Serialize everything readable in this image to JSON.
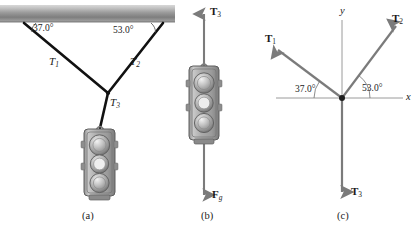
{
  "figure": {
    "background_color": "#ffffff",
    "ink_color": "#1a1a1a",
    "vector_color": "#7b7b7b",
    "axis_color": "#8c8c8c",
    "cable_color": "#111111",
    "width": 416,
    "height": 227
  },
  "panels": [
    {
      "id": "a",
      "caption": "(a)",
      "description": "Traffic light suspended by two cables from a ceiling",
      "angles": [
        {
          "name": "left-angle",
          "value": "37.0°"
        },
        {
          "name": "right-angle",
          "value": "53.0°"
        }
      ],
      "tensions": [
        {
          "name": "T1",
          "symbol": "T",
          "subscript": "1"
        },
        {
          "name": "T2",
          "symbol": "T",
          "subscript": "2"
        },
        {
          "name": "T3",
          "symbol": "T",
          "subscript": "3"
        }
      ]
    },
    {
      "id": "b",
      "caption": "(b)",
      "description": "Free-body diagram of the traffic light",
      "forces": [
        {
          "name": "T3-up",
          "symbol": "T",
          "subscript": "3",
          "direction": "up"
        },
        {
          "name": "Fg-down",
          "symbol": "F",
          "subscript": "g",
          "direction": "down"
        }
      ]
    },
    {
      "id": "c",
      "caption": "(c)",
      "description": "Free-body diagram of the knot with coordinate axes",
      "axes": [
        {
          "name": "x-axis-label",
          "label": "x"
        },
        {
          "name": "y-axis-label",
          "label": "y"
        }
      ],
      "angles": [
        {
          "name": "left-angle",
          "value": "37.0°"
        },
        {
          "name": "right-angle",
          "value": "53.0°"
        }
      ],
      "vectors": [
        {
          "name": "T1",
          "symbol": "T",
          "subscript": "1",
          "angle_deg": 143
        },
        {
          "name": "T2",
          "symbol": "T",
          "subscript": "2",
          "angle_deg": 53
        },
        {
          "name": "T3",
          "symbol": "T",
          "subscript": "3",
          "angle_deg": 270
        }
      ]
    }
  ],
  "labels": {
    "a_T1": "T",
    "a_T1_sub": "1",
    "a_T2": "T",
    "a_T2_sub": "2",
    "a_T3": "T",
    "a_T3_sub": "3",
    "a_angle_left": "37.0°",
    "a_angle_right": "53.0°",
    "a_caption": "(a)",
    "b_T3": "T",
    "b_T3_sub": "3",
    "b_Fg": "F",
    "b_Fg_sub": "g",
    "b_caption": "(b)",
    "c_T1": "T",
    "c_T1_sub": "1",
    "c_T2": "T",
    "c_T2_sub": "2",
    "c_T3": "T",
    "c_T3_sub": "3",
    "c_x": "x",
    "c_y": "y",
    "c_angle_left": "37.0°",
    "c_angle_right": "53.0°",
    "c_caption": "(c)"
  }
}
